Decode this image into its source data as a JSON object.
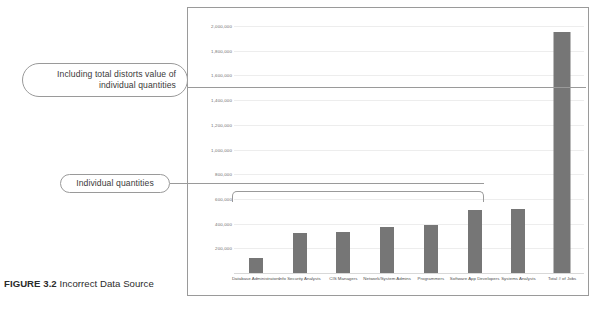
{
  "caption": {
    "figure_label": "FIGURE 3.2",
    "figure_title": " Incorrect Data Source"
  },
  "callouts": {
    "total": "Including total distorts value of individual quantities",
    "individual": "Individual quantities"
  },
  "chart_data": {
    "type": "bar",
    "title": "",
    "xlabel": "",
    "ylabel": "",
    "ylim": [
      0,
      2000000
    ],
    "grid": true,
    "legend": "none",
    "bar_color": "#767676",
    "categories": [
      "Database Administrators",
      "Info Security Analysts",
      "CIS Managers",
      "Network/System Admins",
      "Programmers",
      "Software App Developers",
      "Systems Analysts",
      "Total # of Jobs"
    ],
    "values": [
      120000,
      320000,
      330000,
      370000,
      390000,
      510000,
      520000,
      1950000
    ],
    "ticks": [
      "200,000",
      "400,000",
      "600,000",
      "800,000",
      "1,000,000",
      "1,200,000",
      "1,400,000",
      "1,600,000",
      "1,800,000",
      "2,000,000"
    ],
    "tick_values": [
      200000,
      400000,
      600000,
      800000,
      1000000,
      1200000,
      1400000,
      1600000,
      1800000,
      2000000
    ]
  }
}
